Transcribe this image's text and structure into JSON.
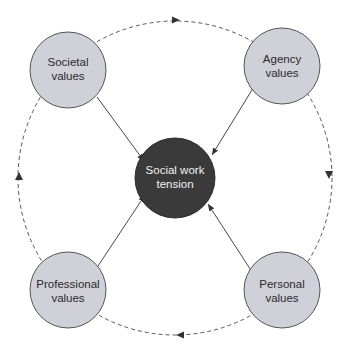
{
  "diagram": {
    "center": {
      "line1": "Social work",
      "line2": "tension",
      "fill": "#3a3a3a"
    },
    "nodes": [
      {
        "id": "societal",
        "line1": "Societal",
        "line2": "values"
      },
      {
        "id": "agency",
        "line1": "Agency",
        "line2": "values"
      },
      {
        "id": "professional",
        "line1": "Professional",
        "line2": "values"
      },
      {
        "id": "personal",
        "line1": "Personal",
        "line2": "values"
      }
    ],
    "node_fill": "#cfd0d8",
    "cycle_direction": "clockwise",
    "edges": [
      {
        "from": "societal",
        "to": "social-work-tension",
        "style": "solid"
      },
      {
        "from": "agency",
        "to": "social-work-tension",
        "style": "solid"
      },
      {
        "from": "professional",
        "to": "social-work-tension",
        "style": "solid"
      },
      {
        "from": "personal",
        "to": "social-work-tension",
        "style": "solid"
      }
    ]
  }
}
